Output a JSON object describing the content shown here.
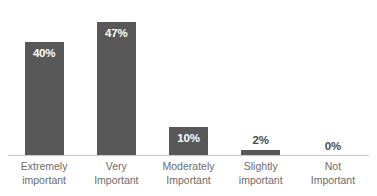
{
  "chart_data": {
    "type": "bar",
    "title": "",
    "subtitle": "",
    "xlabel": "",
    "ylabel": "",
    "ylim": [
      0,
      50
    ],
    "grid": false,
    "legend": false,
    "orientation": "vertical",
    "categories": [
      "Extremely important",
      "Very Important",
      "Moderately Important",
      "Slightly important",
      "Not Important"
    ],
    "category_lines": [
      {
        "line1": "Extremely",
        "line2": "important"
      },
      {
        "line1": "Very",
        "line2": "Important"
      },
      {
        "line1": "Moderately",
        "line2": "Important"
      },
      {
        "line1": "Slightly",
        "line2": "important"
      },
      {
        "line1": "Not",
        "line2": "Important"
      }
    ],
    "values": [
      40,
      47,
      10,
      2,
      0
    ],
    "data_labels": [
      "40%",
      "47%",
      "10%",
      "2%",
      "0%"
    ],
    "label_placement": [
      "inside",
      "inside",
      "inside",
      "above",
      "above"
    ],
    "bars": [
      {
        "category": "Extremely important",
        "value": 40,
        "label": "40%",
        "label_placement": "inside"
      },
      {
        "category": "Very Important",
        "value": 47,
        "label": "47%",
        "label_placement": "inside"
      },
      {
        "category": "Moderately Important",
        "value": 10,
        "label": "10%",
        "label_placement": "inside"
      },
      {
        "category": "Slightly important",
        "value": 2,
        "label": "2%",
        "label_placement": "above"
      },
      {
        "category": "Not Important",
        "value": 0,
        "label": "0%",
        "label_placement": "above"
      }
    ],
    "colors": {
      "bar": "#585858",
      "background": "#ffffff",
      "axis_line": "#c9c9c9",
      "label_inside_text": "#ffffff",
      "label_above_text": "#4a4a4a",
      "category_text": "#6b6b6b"
    }
  }
}
